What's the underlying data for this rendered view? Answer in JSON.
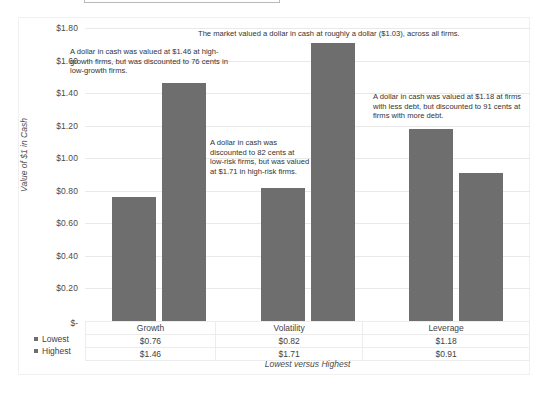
{
  "chart_data": {
    "type": "bar",
    "title": "",
    "xlabel": "Lowest versus Highest",
    "ylabel": "Value of $1 in Cash",
    "categories": [
      "Growth",
      "Volatility",
      "Leverage"
    ],
    "series": [
      {
        "name": "Lowest",
        "values": [
          0.76,
          0.82,
          1.18
        ],
        "labels": [
          "$0.76",
          "$0.82",
          "$1.18"
        ]
      },
      {
        "name": "Highest",
        "values": [
          1.46,
          1.71,
          0.91
        ],
        "labels": [
          "$1.46",
          "$1.71",
          "$0.91"
        ]
      }
    ],
    "ylim": [
      0,
      1.8
    ],
    "ytick_values": [
      1.8,
      1.6,
      1.4,
      1.2,
      1.0,
      0.8,
      0.6,
      0.4,
      0.2,
      0
    ],
    "ytick_labels": [
      "$1.80",
      "$1.60",
      "$1.40",
      "$1.20",
      "$1.00",
      "$0.80",
      "$0.60",
      "$0.40",
      "$0.20",
      "$-"
    ],
    "grid": true,
    "legend_position": "bottom-left",
    "bar_color": "#6e6e6e",
    "gridline_color": "#e9e9e9",
    "annotations": [
      "The market valued a dollar in cash at roughly a dollar ($1.03), across all firms.",
      "A dollar in cash was valued at $1.46 at high-growth firms, but was discounted to 76 cents in low-growth firms.",
      "A dollar in cash was discounted to 82 cents at low-risk firms, but was valued at $1.71 in high-risk firms.",
      "A dollar in cash was valued at $1.18 at firms with less debt, but discounted to 91 cents at firms with more debt."
    ]
  },
  "axis": {
    "y_title": "Value of $1 in Cash",
    "x_title": "Lowest versus Highest",
    "zero_label": "$-",
    "ticks": [
      "$1.80",
      "$1.60",
      "$1.40",
      "$1.20",
      "$1.00",
      "$0.80",
      "$0.60",
      "$0.40",
      "$0.20"
    ]
  },
  "annotations": {
    "overall": "The market valued a dollar in cash at roughly a dollar ($1.03), across all firms.",
    "growth": "A dollar in cash was valued at $1.46 at high-growth firms, but was discounted to 76 cents in low-growth firms.",
    "volatility": "A dollar in cash was discounted to 82 cents at low-risk firms, but was valued at $1.71 in high-risk firms.",
    "leverage": "A dollar in cash was valued at $1.18 at firms with less debt, but discounted to 91 cents at firms with more debt."
  },
  "table": {
    "categories": [
      "Growth",
      "Volatility",
      "Leverage"
    ],
    "rows": [
      {
        "label": "Lowest",
        "cells": [
          "$0.76",
          "$0.82",
          "$1.18"
        ]
      },
      {
        "label": "Highest",
        "cells": [
          "$1.46",
          "$1.71",
          "$0.91"
        ]
      }
    ]
  },
  "legend": {
    "items": [
      {
        "label": "Lowest",
        "color": "#6e6e6e"
      },
      {
        "label": "Highest",
        "color": "#6e6e6e"
      }
    ]
  }
}
